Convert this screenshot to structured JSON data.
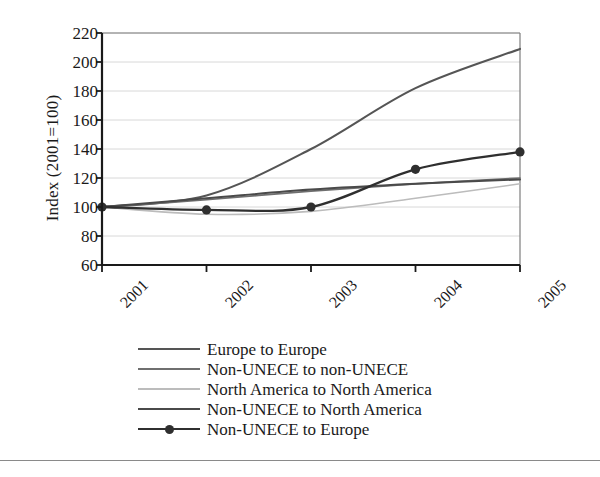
{
  "chart_data": {
    "type": "line",
    "title": "",
    "xlabel": "",
    "ylabel": "Index (2001=100)",
    "x": [
      "2001",
      "2002",
      "2003",
      "2004",
      "2005"
    ],
    "categories": [
      "2001",
      "2002",
      "2003",
      "2004",
      "2005"
    ],
    "xlim": [
      2001,
      2005
    ],
    "ylim": [
      60,
      220
    ],
    "y_ticks": [
      220,
      200,
      180,
      160,
      140,
      120,
      100,
      80,
      60
    ],
    "y_tick_labels": [
      "220",
      "200",
      "180",
      "160",
      "140",
      "120",
      "100",
      "80",
      "60"
    ],
    "x_tick_labels": [
      "2001",
      "2002",
      "2003",
      "2004",
      "2005"
    ],
    "grid": "horizontal",
    "legend_position": "bottom",
    "marker_series": "Non-UNECE to Europe",
    "series": [
      {
        "name": "Europe to Europe",
        "color": "#555555",
        "width": 2.1,
        "marker": "none",
        "values": [
          100,
          108,
          140,
          182,
          209
        ]
      },
      {
        "name": "Non-UNECE to non-UNECE",
        "color": "#6f6f6f",
        "width": 1.7,
        "marker": "none",
        "values": [
          100,
          105,
          111,
          116,
          120
        ]
      },
      {
        "name": "North America to North America",
        "color": "#bcbcbc",
        "width": 1.6,
        "marker": "none",
        "values": [
          100,
          95,
          97,
          106,
          116
        ]
      },
      {
        "name": "Non-UNECE to North America",
        "color": "#4a4a4a",
        "width": 2.0,
        "marker": "none",
        "values": [
          100,
          106,
          112,
          116,
          119
        ]
      },
      {
        "name": "Non-UNECE to Europe",
        "color": "#2f2f2f",
        "width": 2.3,
        "marker": "circle",
        "values": [
          100,
          98,
          100,
          126,
          138
        ]
      }
    ]
  },
  "axes": {
    "y_title": "Index (2001=100)",
    "axis_color": "#1a1a1a",
    "grid_color": "#d8d8d8",
    "plot_border_color": "#7d7d7d"
  },
  "legend": {
    "items": [
      {
        "label": "Europe to Europe",
        "color": "#555555",
        "width": 2.6,
        "marker": false
      },
      {
        "label": "Non-UNECE to non-UNECE",
        "color": "#6f6f6f",
        "width": 2.0,
        "marker": false
      },
      {
        "label": "North America to North America",
        "color": "#bcbcbc",
        "width": 2.0,
        "marker": false
      },
      {
        "label": "Non-UNECE to North America",
        "color": "#4a4a4a",
        "width": 2.6,
        "marker": false
      },
      {
        "label": "Non-UNECE to Europe",
        "color": "#2f2f2f",
        "width": 2.6,
        "marker": true
      }
    ]
  }
}
